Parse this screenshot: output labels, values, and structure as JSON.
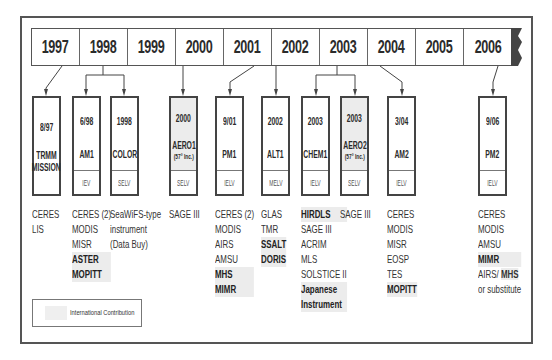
{
  "timeline": {
    "years": [
      "1997",
      "1998",
      "1999",
      "2000",
      "2001",
      "2002",
      "2003",
      "2004",
      "2005",
      "2006"
    ]
  },
  "missions": [
    {
      "id": "trmm",
      "date": "8/97",
      "name": "TRMM MISSION",
      "name_lines": [
        "TRMM",
        "MISSION"
      ],
      "note": "",
      "agency": "",
      "international": false,
      "instruments": [
        {
          "text": "CERES",
          "intl": false
        },
        {
          "text": "LIS",
          "intl": false
        }
      ]
    },
    {
      "id": "am1",
      "date": "6/98",
      "name": "AM1",
      "name_lines": [
        "AM1"
      ],
      "note": "",
      "agency": "IEV",
      "international": false,
      "instruments": [
        {
          "text": "CERES (2)",
          "intl": false
        },
        {
          "text": "MODIS",
          "intl": false
        },
        {
          "text": "MISR",
          "intl": false
        },
        {
          "text": "ASTER",
          "intl": true
        },
        {
          "text": "MOPITT",
          "intl": true
        }
      ]
    },
    {
      "id": "color",
      "date": "1998",
      "name": "COLOR",
      "name_lines": [
        "COLOR"
      ],
      "note": "",
      "agency": "SELV",
      "international": false,
      "instruments": [
        {
          "text": "SeaWiFS-type",
          "intl": false
        },
        {
          "text": "instrument",
          "intl": false
        },
        {
          "text": "(Data Buy)",
          "intl": false
        }
      ]
    },
    {
      "id": "aero1",
      "date": "2000",
      "name": "AERO1",
      "name_lines": [
        "AERO1"
      ],
      "note": "(57° Inc.)",
      "agency": "SELV",
      "international": true,
      "instruments": [
        {
          "text": "SAGE III",
          "intl": false
        }
      ]
    },
    {
      "id": "pm1",
      "date": "9/01",
      "name": "PM1",
      "name_lines": [
        "PM1"
      ],
      "note": "",
      "agency": "IELV",
      "international": false,
      "instruments": [
        {
          "text": "CERES (2)",
          "intl": false
        },
        {
          "text": "MODIS",
          "intl": false
        },
        {
          "text": "AIRS",
          "intl": false
        },
        {
          "text": "AMSU",
          "intl": false
        },
        {
          "text": "MHS",
          "intl": true
        },
        {
          "text": "MIMR",
          "intl": true
        }
      ]
    },
    {
      "id": "alt1",
      "date": "2002",
      "name": "ALT1",
      "name_lines": [
        "ALT1"
      ],
      "note": "",
      "agency": "MELV",
      "international": false,
      "instruments": [
        {
          "text": "GLAS",
          "intl": false
        },
        {
          "text": "TMR",
          "intl": false
        },
        {
          "text": "SSALT",
          "intl": true
        },
        {
          "text": "DORIS",
          "intl": true
        }
      ]
    },
    {
      "id": "chem1",
      "date": "2003",
      "name": "CHEM1",
      "name_lines": [
        "CHEM1"
      ],
      "note": "",
      "agency": "IELV",
      "international": false,
      "instruments": [
        {
          "text": "HIRDLS",
          "intl": true
        },
        {
          "text": "SAGE III",
          "intl": false
        },
        {
          "text": "ACRIM",
          "intl": false
        },
        {
          "text": "MLS",
          "intl": false
        },
        {
          "text": "SOLSTICE II",
          "intl": false
        },
        {
          "text": "Japanese",
          "intl": true
        },
        {
          "text": "Instrument",
          "intl": true
        }
      ]
    },
    {
      "id": "aero2",
      "date": "2003",
      "name": "AERO2",
      "name_lines": [
        "AERO2"
      ],
      "note": "(57° Inc.)",
      "agency": "SELV",
      "international": true,
      "instruments": [
        {
          "text": "SAGE III",
          "intl": false
        }
      ]
    },
    {
      "id": "am2",
      "date": "3/04",
      "name": "AM2",
      "name_lines": [
        "AM2"
      ],
      "note": "",
      "agency": "IELV",
      "international": false,
      "instruments": [
        {
          "text": "CERES",
          "intl": false
        },
        {
          "text": "MODIS",
          "intl": false
        },
        {
          "text": "MISR",
          "intl": false
        },
        {
          "text": "EOSP",
          "intl": false
        },
        {
          "text": "TES",
          "intl": false
        },
        {
          "text": "MOPITT",
          "intl": true
        }
      ]
    },
    {
      "id": "pm2",
      "date": "9/06",
      "name": "PM2",
      "name_lines": [
        "PM2"
      ],
      "note": "",
      "agency": "IELV",
      "international": false,
      "instruments": [
        {
          "text": "CERES",
          "intl": false
        },
        {
          "text": "MODIS",
          "intl": false
        },
        {
          "text": "AMSU",
          "intl": false
        },
        {
          "text": "MIMR",
          "intl": true
        },
        {
          "text": "AIRS/ MHS",
          "intl": false,
          "partial_intl": "MHS"
        },
        {
          "text": "or substitute",
          "intl": false
        }
      ]
    }
  ],
  "legend": {
    "label": "International Contribution"
  },
  "colors": {
    "frame": "#555555",
    "international_fill": "#ececec",
    "flag": "#444444"
  }
}
